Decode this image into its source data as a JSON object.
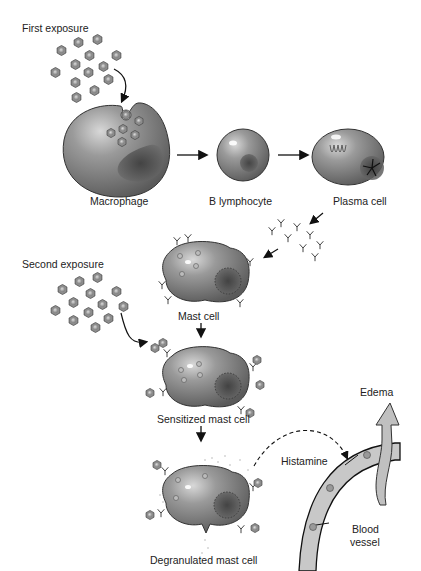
{
  "labels": {
    "first_exposure": "First exposure",
    "macrophage": "Macrophage",
    "b_lymphocyte": "B lymphocyte",
    "plasma_cell": "Plasma cell",
    "second_exposure": "Second exposure",
    "mast_cell": "Mast cell",
    "sensitized_mast_cell": "Sensitized mast cell",
    "degranulated_mast_cell": "Degranulated mast cell",
    "histamine": "Histamine",
    "edema": "Edema",
    "blood_vessel_line1": "Blood",
    "blood_vessel_line2": "vessel"
  },
  "colors": {
    "cell_fill": "#8a8a8a",
    "cell_dark": "#5e5e5e",
    "antigen_fill": "#9a9a9a",
    "vessel_fill": "#c8c8c8",
    "line": "#111111"
  }
}
